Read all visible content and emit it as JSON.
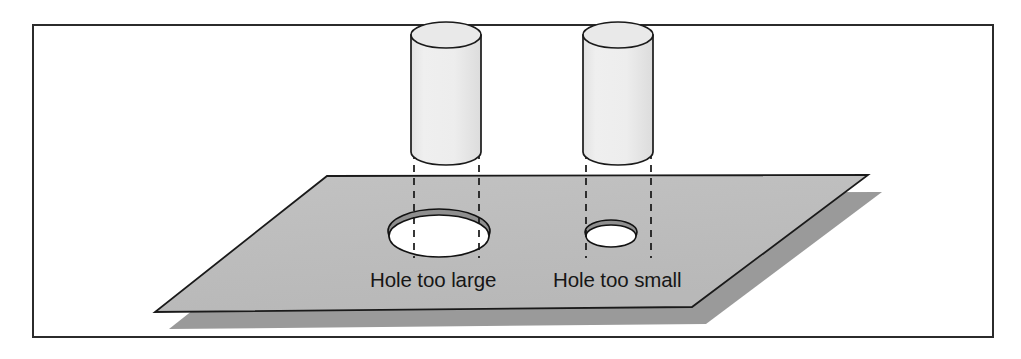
{
  "figure": {
    "kind": "technical-illustration",
    "caption_labels": {
      "left": "Hole too large",
      "right": "Hole too small"
    },
    "colors": {
      "page_background": "#ffffff",
      "frame_border": "#2b2b2b",
      "plane_fill": "#bdbdbd",
      "plane_outline": "#1a1a1a",
      "plane_shadow": "#9a9a9a",
      "cylinder_body_fill": "#ebebeb",
      "cylinder_top_fill": "#e4e4e4",
      "cylinder_outline": "#1a1a1a",
      "hole_fill": "#ffffff",
      "hole_rim": "#6b6b6b",
      "hole_outline": "#121212",
      "dashed_line": "#161616",
      "label_text": "#161616"
    },
    "frame": {
      "x": 33,
      "y": 25,
      "width": 960,
      "height": 312,
      "stroke_width": 2
    },
    "plane": {
      "top_left": [
        327,
        176
      ],
      "top_right": [
        868,
        175
      ],
      "bottom_right": [
        692,
        307
      ],
      "bottom_left": [
        155,
        312
      ],
      "shadow_offset_x": 14,
      "shadow_offset_y": 17
    },
    "cylinders": [
      {
        "name": "left-cylinder",
        "label_ref": "Hole too large",
        "cx": 446,
        "top_y": 35,
        "bottom_y": 152,
        "rx": 35,
        "ry": 13
      },
      {
        "name": "right-cylinder",
        "label_ref": "Hole too small",
        "cx": 618,
        "top_y": 35,
        "bottom_y": 152,
        "rx": 35,
        "ry": 13
      }
    ],
    "holes": [
      {
        "name": "large-hole",
        "label_ref": "Hole too large",
        "cx": 439,
        "cy": 234,
        "rx": 51,
        "ry": 22,
        "relation": "larger-than-cylinder"
      },
      {
        "name": "small-hole",
        "label_ref": "Hole too small",
        "cx": 611,
        "cy": 235,
        "rx": 26,
        "ry": 12,
        "relation": "smaller-than-cylinder"
      }
    ],
    "projection_lines": [
      {
        "name": "left-cylinder-left-projection",
        "x": 414,
        "y1": 152,
        "y2": 258
      },
      {
        "name": "left-cylinder-right-projection",
        "x": 479,
        "y1": 152,
        "y2": 258
      },
      {
        "name": "right-cylinder-left-projection",
        "x": 586,
        "y1": 152,
        "y2": 258
      },
      {
        "name": "right-cylinder-right-projection",
        "x": 651,
        "y1": 152,
        "y2": 258
      }
    ],
    "label_positions": {
      "left": {
        "x": 370,
        "y": 287
      },
      "right": {
        "x": 553,
        "y": 287
      }
    }
  }
}
